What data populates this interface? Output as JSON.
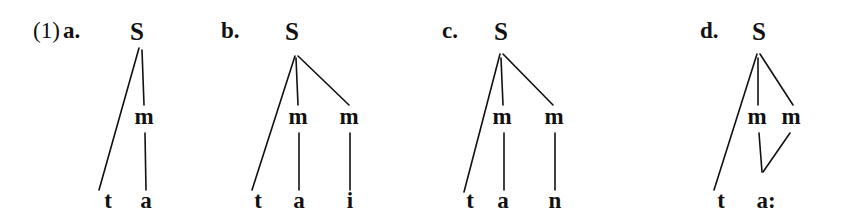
{
  "figure": {
    "example_number": "(1)",
    "ink_color": "#111111",
    "background_color": "#ffffff"
  },
  "trees": [
    {
      "label": "a.",
      "label_x": 63,
      "label_y": 38,
      "root": {
        "text": "S",
        "x": 137,
        "y": 40
      },
      "moras": [
        {
          "text": "m",
          "x": 144,
          "y": 124
        }
      ],
      "terminals": [
        {
          "text": "t",
          "x": 108,
          "y": 208
        },
        {
          "text": "a",
          "x": 146,
          "y": 208
        }
      ],
      "branches": [
        {
          "x1": 139,
          "y1": 48,
          "x2": 99,
          "y2": 190
        },
        {
          "x1": 142,
          "y1": 50,
          "x2": 144,
          "y2": 105
        },
        {
          "x1": 145,
          "y1": 133,
          "x2": 146,
          "y2": 190
        }
      ]
    },
    {
      "label": "b.",
      "label_x": 221,
      "label_y": 38,
      "root": {
        "text": "S",
        "x": 292,
        "y": 40
      },
      "moras": [
        {
          "text": "m",
          "x": 298,
          "y": 124
        },
        {
          "text": "m",
          "x": 349,
          "y": 124
        }
      ],
      "terminals": [
        {
          "text": "t",
          "x": 258,
          "y": 208
        },
        {
          "text": "a",
          "x": 299,
          "y": 208
        },
        {
          "text": "i",
          "x": 350,
          "y": 208
        }
      ],
      "branches": [
        {
          "x1": 295,
          "y1": 56,
          "x2": 252,
          "y2": 190
        },
        {
          "x1": 296,
          "y1": 58,
          "x2": 298,
          "y2": 105
        },
        {
          "x1": 298,
          "y1": 56,
          "x2": 349,
          "y2": 105
        },
        {
          "x1": 299,
          "y1": 133,
          "x2": 299,
          "y2": 190
        },
        {
          "x1": 350,
          "y1": 133,
          "x2": 350,
          "y2": 190
        }
      ]
    },
    {
      "label": "c.",
      "label_x": 442,
      "label_y": 38,
      "root": {
        "text": "S",
        "x": 501,
        "y": 40
      },
      "moras": [
        {
          "text": "m",
          "x": 502,
          "y": 124
        },
        {
          "text": "m",
          "x": 554,
          "y": 124
        }
      ],
      "terminals": [
        {
          "text": "t",
          "x": 470,
          "y": 208
        },
        {
          "text": "a",
          "x": 503,
          "y": 208
        },
        {
          "text": "n",
          "x": 555,
          "y": 208
        }
      ],
      "branches": [
        {
          "x1": 500,
          "y1": 54,
          "x2": 464,
          "y2": 192
        },
        {
          "x1": 501,
          "y1": 58,
          "x2": 503,
          "y2": 105
        },
        {
          "x1": 503,
          "y1": 54,
          "x2": 553,
          "y2": 105
        },
        {
          "x1": 504,
          "y1": 133,
          "x2": 504,
          "y2": 190
        },
        {
          "x1": 555,
          "y1": 133,
          "x2": 555,
          "y2": 190
        }
      ]
    },
    {
      "label": "d.",
      "label_x": 700,
      "label_y": 38,
      "root": {
        "text": "S",
        "x": 759,
        "y": 40
      },
      "moras": [
        {
          "text": "m",
          "x": 757,
          "y": 124
        },
        {
          "text": "m",
          "x": 791,
          "y": 124
        }
      ],
      "terminals": [
        {
          "text": "t",
          "x": 721,
          "y": 208
        },
        {
          "text": "a:",
          "x": 766,
          "y": 208
        }
      ],
      "branches": [
        {
          "x1": 757,
          "y1": 54,
          "x2": 714,
          "y2": 190
        },
        {
          "x1": 758,
          "y1": 58,
          "x2": 758,
          "y2": 105
        },
        {
          "x1": 760,
          "y1": 54,
          "x2": 793,
          "y2": 105
        },
        {
          "x1": 759,
          "y1": 133,
          "x2": 762,
          "y2": 172
        },
        {
          "x1": 790,
          "y1": 133,
          "x2": 763,
          "y2": 172
        }
      ]
    }
  ]
}
